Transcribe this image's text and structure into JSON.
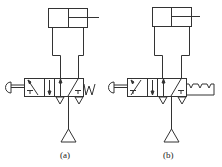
{
  "diagrams": [
    {
      "id": "a",
      "label": "(a)",
      "actuator": "push-button",
      "return": "spring"
    },
    {
      "id": "b",
      "label": "(b)",
      "actuator": "push-button",
      "return": "detent"
    }
  ],
  "colors": {
    "stroke": "#333333",
    "background": "#ffffff"
  }
}
